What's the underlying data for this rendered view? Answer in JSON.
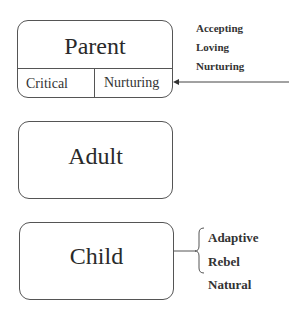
{
  "diagram": {
    "parent": {
      "title": "Parent",
      "sub_left": "Critical",
      "sub_right": "Nurturing",
      "annotations": [
        "Accepting",
        "Loving",
        "Nurturing"
      ]
    },
    "adult": {
      "title": "Adult"
    },
    "child": {
      "title": "Child",
      "annotations": [
        "Adaptive",
        "Rebel",
        "Natural"
      ]
    },
    "colors": {
      "line": "#555555",
      "text": "#2a2a2a"
    }
  }
}
